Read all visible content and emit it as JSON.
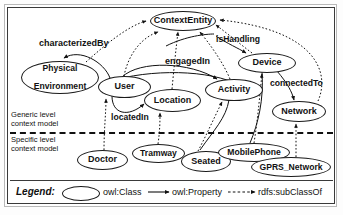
{
  "diagram": {
    "levels": {
      "generic": "Generic level\ncontext model",
      "generic_line1": "Generic level",
      "generic_line2": "context model",
      "specific_line1": "Specific level",
      "specific_line2": "context model"
    },
    "nodes": [
      {
        "id": "context-entity",
        "label": "ContextEntity",
        "x": 150,
        "y": 11,
        "w": 66,
        "h": 20,
        "fs": 9.0
      },
      {
        "id": "physical-environment",
        "label": "Physical\nEnvironment",
        "line1": "Physical",
        "line2": "Environment",
        "x": 21,
        "y": 61,
        "w": 78,
        "h": 33,
        "fs": 8.6
      },
      {
        "id": "user",
        "label": "User",
        "x": 98,
        "y": 76,
        "w": 53,
        "h": 22,
        "fs": 9.0
      },
      {
        "id": "location",
        "label": "Location",
        "x": 144,
        "y": 89,
        "w": 57,
        "h": 23,
        "fs": 9.0
      },
      {
        "id": "device",
        "label": "Device",
        "x": 238,
        "y": 53,
        "w": 58,
        "h": 20,
        "fs": 9.0
      },
      {
        "id": "activity",
        "label": "Activity",
        "x": 205,
        "y": 79,
        "w": 58,
        "h": 22,
        "fs": 9.0
      },
      {
        "id": "network",
        "label": "Network",
        "x": 272,
        "y": 101,
        "w": 54,
        "h": 21,
        "fs": 9.0
      },
      {
        "id": "doctor",
        "label": "Doctor",
        "x": 77,
        "y": 150,
        "w": 51,
        "h": 20,
        "fs": 9.0
      },
      {
        "id": "tramway",
        "label": "Tramway",
        "x": 132,
        "y": 144,
        "w": 53,
        "h": 19,
        "fs": 8.6
      },
      {
        "id": "seated",
        "label": "Seated",
        "x": 181,
        "y": 151,
        "w": 50,
        "h": 21,
        "fs": 9.0
      },
      {
        "id": "mobile-phone",
        "label": "MobilePhone",
        "x": 218,
        "y": 143,
        "w": 72,
        "h": 19,
        "fs": 8.6
      },
      {
        "id": "gprs-network",
        "label": "GPRS_Network",
        "x": 251,
        "y": 157,
        "w": 80,
        "h": 20,
        "fs": 8.6
      }
    ],
    "edge_labels": [
      {
        "id": "characterized-by",
        "label": "characterizedBy",
        "x": 39,
        "y": 38,
        "fs": 9.0
      },
      {
        "id": "is-handling",
        "label": "isHandling",
        "x": 216,
        "y": 34,
        "fs": 8.6
      },
      {
        "id": "engaged-in",
        "label": "engagedIn",
        "x": 165,
        "y": 56,
        "fs": 9.0
      },
      {
        "id": "connected-to",
        "label": "connectedTo",
        "x": 270,
        "y": 78,
        "fs": 8.6
      },
      {
        "id": "located-in",
        "label": "locatedIn",
        "x": 111,
        "y": 112,
        "fs": 8.6
      }
    ],
    "edges": [
      {
        "from": "User",
        "to": "PhysicalEnvironment",
        "relation": "characterizedBy",
        "type": "owl:Property"
      },
      {
        "from": "User",
        "to": "Location",
        "relation": "locatedIn",
        "type": "owl:Property"
      },
      {
        "from": "User",
        "to": "Activity",
        "relation": "engagedIn",
        "type": "owl:Property"
      },
      {
        "from": "Device",
        "to": "Activity",
        "relation": "isHandling",
        "type": "owl:Property"
      },
      {
        "from": "Device",
        "to": "Network",
        "relation": "connectedTo",
        "type": "owl:Property"
      },
      {
        "from": "PhysicalEnvironment",
        "to": "ContextEntity",
        "relation": "",
        "type": "rdfs:subClassOf"
      },
      {
        "from": "User",
        "to": "ContextEntity",
        "relation": "",
        "type": "rdfs:subClassOf"
      },
      {
        "from": "Location",
        "to": "ContextEntity",
        "relation": "",
        "type": "rdfs:subClassOf"
      },
      {
        "from": "Activity",
        "to": "ContextEntity",
        "relation": "",
        "type": "rdfs:subClassOf"
      },
      {
        "from": "Device",
        "to": "ContextEntity",
        "relation": "",
        "type": "rdfs:subClassOf"
      },
      {
        "from": "Network",
        "to": "ContextEntity",
        "relation": "",
        "type": "rdfs:subClassOf"
      },
      {
        "from": "Doctor",
        "to": "User",
        "relation": "",
        "type": "rdfs:subClassOf"
      },
      {
        "from": "Tramway",
        "to": "Location",
        "relation": "",
        "type": "rdfs:subClassOf"
      },
      {
        "from": "Seated",
        "to": "Activity",
        "relation": "",
        "type": "rdfs:subClassOf"
      },
      {
        "from": "MobilePhone",
        "to": "Device",
        "relation": "",
        "type": "rdfs:subClassOf"
      },
      {
        "from": "GPRS_Network",
        "to": "Network",
        "relation": "",
        "type": "rdfs:subClassOf"
      }
    ],
    "legend": {
      "title": "Legend:",
      "class_label": "owl:Class",
      "property_label": "owl:Property",
      "subclass_label": "rdfs:subClassOf"
    }
  }
}
